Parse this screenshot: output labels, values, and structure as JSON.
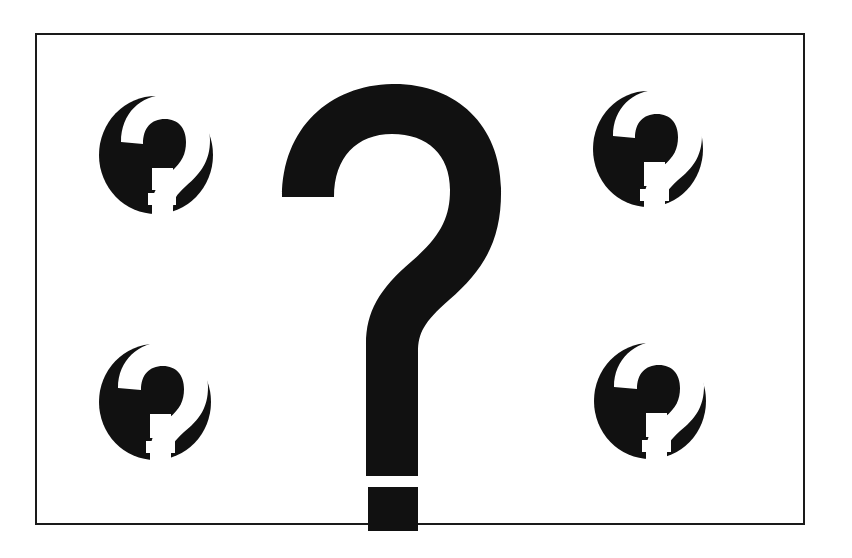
{
  "canvas": {
    "width": 852,
    "height": 558,
    "background_color": "#ffffff",
    "ink_color": "#111111",
    "title": "Question Marks Illustration"
  },
  "frame": {
    "name": "border-frame",
    "x": 35,
    "y": 33,
    "width": 770,
    "height": 492,
    "stroke_color": "#1a1a1a",
    "stroke_width": 2,
    "fill_color": "#ffffff"
  },
  "main_glyph": {
    "name": "large-question-mark",
    "character": "?",
    "fill_color": "#111111",
    "center_x": 408,
    "hook_top_y": 84,
    "stem_bottom_y": 475,
    "dot_top_y": 487,
    "dot_bottom_y": 530,
    "stroke_thickness": 52
  },
  "corner_icons": [
    {
      "name": "question-mark-badge-top-left",
      "position": "top-left",
      "character": "?",
      "circle_center_x": 156,
      "circle_center_y": 155,
      "circle_radius_x": 57,
      "circle_radius_y": 59,
      "circle_color": "#111111",
      "mark_color": "#ffffff"
    },
    {
      "name": "question-mark-badge-top-right",
      "position": "top-right",
      "character": "?",
      "circle_center_x": 648,
      "circle_center_y": 149,
      "circle_radius_x": 55,
      "circle_radius_y": 58,
      "circle_color": "#111111",
      "mark_color": "#ffffff"
    },
    {
      "name": "question-mark-badge-bottom-left",
      "position": "bottom-left",
      "character": "?",
      "circle_center_x": 155,
      "circle_center_y": 402,
      "circle_radius_x": 56,
      "circle_radius_y": 58,
      "circle_color": "#111111",
      "mark_color": "#ffffff"
    },
    {
      "name": "question-mark-badge-bottom-right",
      "position": "bottom-right",
      "character": "?",
      "circle_center_x": 650,
      "circle_center_y": 401,
      "circle_radius_x": 56,
      "circle_radius_y": 58,
      "circle_color": "#111111",
      "mark_color": "#ffffff"
    }
  ],
  "alt_text": "A bordered panel containing one large black question mark in the center and four smaller black circular badges with white question marks in each corner."
}
